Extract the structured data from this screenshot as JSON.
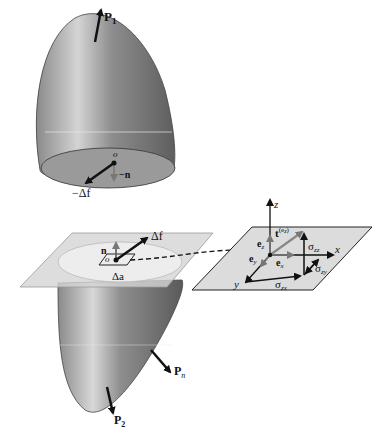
{
  "figure": {
    "top_body": {
      "force_label": "P",
      "force_sub": "1",
      "origin_label": "o",
      "normal_label": "−n",
      "force_increment_label": "−Δf"
    },
    "bottom_body": {
      "normal_label": "n",
      "force_increment_label": "Δf",
      "origin_label": "o",
      "area_label": "Δa",
      "force_n_label": "P",
      "force_n_sub": "n",
      "force_2_label": "P",
      "force_2_sub": "2"
    },
    "detail_plane": {
      "axis_z": "z",
      "axis_x": "x",
      "axis_y": "y",
      "e_z": "e",
      "e_z_sub": "z",
      "e_x": "e",
      "e_x_sub": "x",
      "e_y": "e",
      "e_y_sub": "y",
      "traction": "t",
      "traction_sup": "(e",
      "traction_sup_sub": "z",
      "traction_sup_close": ")",
      "sigma_zz": "σ",
      "sigma_zz_sub": "zz",
      "sigma_zy": "σ",
      "sigma_zy_sub": "zy",
      "sigma_zx": "σ",
      "sigma_zx_sub": "zx"
    },
    "colors": {
      "body_dark": "#6e6e6e",
      "body_light": "#c8c8c8",
      "plane": "#d9d9d9",
      "cut_face": "#ececec",
      "arrow": "#111111"
    }
  }
}
